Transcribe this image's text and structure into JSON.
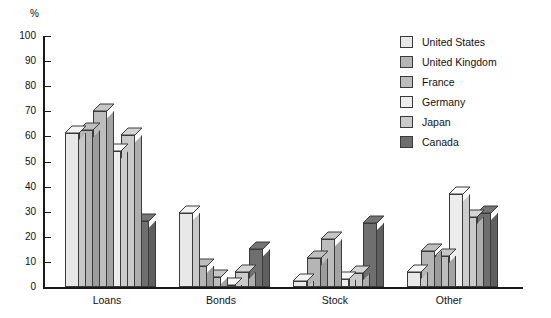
{
  "chart_data": {
    "type": "bar",
    "title": "",
    "subtitle": "",
    "xlabel": "",
    "ylabel": "%",
    "ylim": [
      0,
      100
    ],
    "ytick_step": 10,
    "yticks": [
      "100",
      "90",
      "80",
      "70",
      "60",
      "50",
      "40",
      "30",
      "20",
      "10",
      "0"
    ],
    "grid": false,
    "legend_position": "right",
    "categories": [
      "Loans",
      "Bonds",
      "Stock",
      "Other"
    ],
    "series": [
      {
        "name": "United States",
        "color": "#e8e8e8",
        "values": [
          61.5,
          29.5,
          2.5,
          6.0
        ]
      },
      {
        "name": "United Kingdom",
        "color": "#b5b5b5",
        "values": [
          62.5,
          8.5,
          11.5,
          14.5
        ]
      },
      {
        "name": "France",
        "color": "#bdbdbd",
        "values": [
          70.0,
          4.0,
          19.0,
          12.5
        ]
      },
      {
        "name": "Germany",
        "color": "#ededed",
        "values": [
          54.0,
          1.0,
          3.0,
          37.0
        ]
      },
      {
        "name": "Japan",
        "color": "#cacaca",
        "values": [
          60.5,
          6.0,
          5.5,
          28.0
        ]
      },
      {
        "name": "Canada",
        "color": "#6f6f6f",
        "values": [
          26.5,
          15.0,
          25.5,
          29.5
        ]
      }
    ]
  },
  "axis": {
    "unit_label": "%"
  }
}
